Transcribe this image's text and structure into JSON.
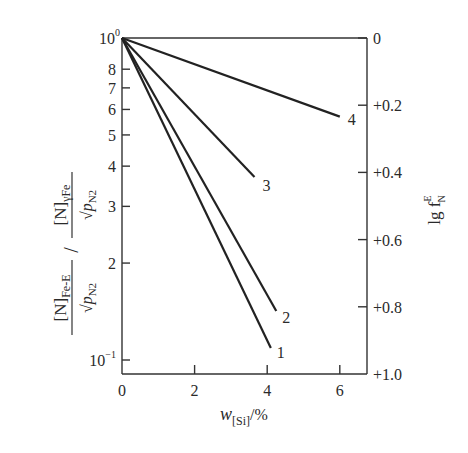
{
  "chart_data": {
    "type": "line",
    "title": "",
    "xlabel": "w[Si]/%",
    "xlabel_parts": {
      "main": "w",
      "sub": "[Si]",
      "suffix": "/%"
    },
    "ylabel_left": "[N]Fe-E / √pN2  /  [N]γFe / √pN2",
    "ylabel_left_parts": {
      "num1": "[N]",
      "num1_sub": "Fe-E",
      "den1": "√p",
      "den1_sub": "N2",
      "num2": "[N]",
      "num2_sub": "γFe",
      "den2": "√p",
      "den2_sub": "N2"
    },
    "ylabel_right": "lg f N E",
    "ylabel_right_parts": {
      "main": "lg f",
      "sup": "E",
      "sub": "N"
    },
    "xlim": [
      0,
      6.8
    ],
    "ylim_left": [
      0.1,
      1.0
    ],
    "yscale_left": "log",
    "ylim_right": [
      0,
      1.0
    ],
    "yscale_right_inverted": true,
    "grid": false,
    "legend": "inline numeric labels at line ends",
    "x_ticks": [
      0,
      2,
      4,
      6
    ],
    "x_tick_labels": [
      "0",
      "2",
      "4",
      "6"
    ],
    "y_left_ticks": [
      1.0,
      0.8,
      0.7,
      0.6,
      0.5,
      0.4,
      0.3,
      0.2,
      0.1
    ],
    "y_left_tick_labels": [
      "10⁰",
      "8",
      "7",
      "6",
      "5",
      "4",
      "3",
      "2",
      "10⁻¹"
    ],
    "y_right_ticks": [
      0,
      0.2,
      0.4,
      0.6,
      0.8,
      1.0
    ],
    "y_right_tick_labels": [
      "0",
      "+0.2",
      "+0.4",
      "+0.6",
      "+0.8",
      "+1.0"
    ],
    "series": [
      {
        "name": "1",
        "x": [
          0,
          4.1
        ],
        "y": [
          1.0,
          0.109
        ]
      },
      {
        "name": "2",
        "x": [
          0,
          4.25
        ],
        "y": [
          1.0,
          0.142
        ]
      },
      {
        "name": "3",
        "x": [
          0,
          3.65
        ],
        "y": [
          1.0,
          0.37
        ]
      },
      {
        "name": "4",
        "x": [
          0,
          6.0
        ],
        "y": [
          1.0,
          0.57
        ]
      }
    ]
  },
  "colors": {
    "ink": "#2a2a2a",
    "background": "#ffffff"
  }
}
